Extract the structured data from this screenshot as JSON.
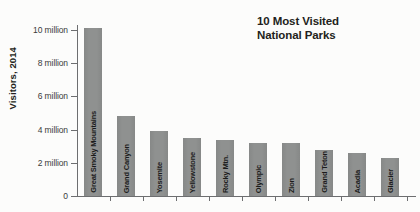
{
  "window": {
    "width": 420,
    "height": 212
  },
  "title": {
    "line1": "10 Most Visited",
    "line2": "National Parks"
  },
  "chart_data": {
    "type": "bar",
    "title": "10 Most Visited National Parks",
    "xlabel": "",
    "ylabel": "Visitors, 2014",
    "unit": "millions of visitors",
    "categories": [
      "Great Smoky Mountains",
      "Grand Canyon",
      "Yosemite",
      "Yellowstone",
      "Rocky Mtn.",
      "Olympic",
      "Zion",
      "Grand Teton",
      "Acadia",
      "Glacier"
    ],
    "values": [
      10.1,
      4.8,
      3.9,
      3.5,
      3.4,
      3.2,
      3.2,
      2.8,
      2.6,
      2.3
    ],
    "ylim": [
      0,
      10
    ],
    "yticks": [
      {
        "value": 0,
        "label": "0"
      },
      {
        "value": 2,
        "label": "2 million"
      },
      {
        "value": 4,
        "label": "4 million"
      },
      {
        "value": 6,
        "label": "6 million"
      },
      {
        "value": 8,
        "label": "8 million"
      },
      {
        "value": 10,
        "label": "10 million"
      }
    ],
    "grid": false,
    "legend": "none",
    "colors": {
      "bar": "#8f9190",
      "bar_label": "#1b1b1b",
      "axis": "#6d6e70",
      "tick_text": "#3a3a3a",
      "title_text": "#231f20",
      "background": "#fcfcfb"
    }
  }
}
